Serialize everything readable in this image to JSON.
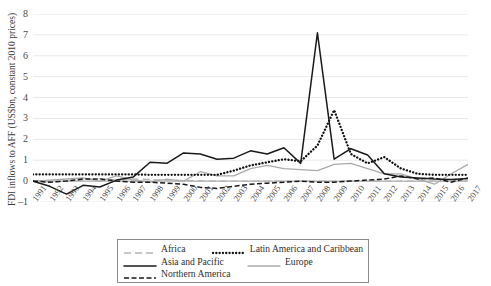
{
  "chart_data": {
    "type": "line",
    "title": "",
    "xlabel": "",
    "ylabel": "FDI inflows to AFF (US$bn, constant 2010 prices)",
    "ylim": [
      -1,
      8
    ],
    "yticks": [
      -1,
      0,
      1,
      2,
      3,
      4,
      5,
      6,
      7,
      8
    ],
    "grid": true,
    "legend_position": "bottom",
    "x": [
      1991,
      1992,
      1993,
      1994,
      1995,
      1996,
      1997,
      1998,
      1999,
      2000,
      2001,
      2002,
      2003,
      2004,
      2005,
      2006,
      2007,
      2008,
      2009,
      2010,
      2011,
      2012,
      2013,
      2014,
      2015,
      2016,
      2017
    ],
    "categories": [
      "1991",
      "1992",
      "1993",
      "1994",
      "1995",
      "1996",
      "1997",
      "1998",
      "1999",
      "2000",
      "2001",
      "2002",
      "2003",
      "2004",
      "2005",
      "2006",
      "2007",
      "2008",
      "2009",
      "2010",
      "2011",
      "2012",
      "2013",
      "2014",
      "2015",
      "2016",
      "2017"
    ],
    "series": [
      {
        "name": "Africa",
        "color": "#b4b4b4",
        "style": "long-dash",
        "values": [
          0.02,
          -0.05,
          0.02,
          0.05,
          0.12,
          0.05,
          0.1,
          0.08,
          0.05,
          0.03,
          0.02,
          0.0,
          0.0,
          0.0,
          0.0,
          0.0,
          0.0,
          0.0,
          0.0,
          0.0,
          0.0,
          0.0,
          0.0,
          0.0,
          0.0,
          0.0,
          0.0
        ]
      },
      {
        "name": "Asia and Pacific",
        "color": "#1a1a1a",
        "style": "solid",
        "values": [
          0.0,
          -0.25,
          -0.62,
          -0.2,
          -0.28,
          0.05,
          0.2,
          0.9,
          0.85,
          1.35,
          1.3,
          1.05,
          1.1,
          1.45,
          1.3,
          1.6,
          0.85,
          7.1,
          1.05,
          1.55,
          1.25,
          0.35,
          0.2,
          0.15,
          0.1,
          0.08,
          0.12
        ]
      },
      {
        "name": "Northern America",
        "color": "#1a1a1a",
        "style": "dash",
        "values": [
          0.0,
          -0.05,
          0.0,
          0.1,
          0.1,
          0.0,
          -0.05,
          -0.05,
          -0.1,
          -0.15,
          -0.3,
          -0.35,
          -0.25,
          -0.15,
          -0.1,
          -0.05,
          0.0,
          -0.05,
          -0.05,
          0.0,
          0.05,
          0.1,
          0.25,
          0.1,
          0.15,
          -0.05,
          0.15
        ]
      },
      {
        "name": "Latin America and Caribbean",
        "color": "#111111",
        "style": "dot",
        "values": [
          0.32,
          0.32,
          0.32,
          0.32,
          0.32,
          0.32,
          0.32,
          0.3,
          0.3,
          0.3,
          0.3,
          0.3,
          0.5,
          0.75,
          0.9,
          1.05,
          0.95,
          1.7,
          3.4,
          1.3,
          0.85,
          1.15,
          0.6,
          0.35,
          0.3,
          0.3,
          0.3
        ]
      },
      {
        "name": "Europe",
        "color": "#aaaaaa",
        "style": "solid-gray",
        "values": [
          0.0,
          0.05,
          0.1,
          0.15,
          0.0,
          0.25,
          0.05,
          -0.05,
          0.1,
          0.0,
          0.45,
          0.25,
          0.25,
          0.6,
          0.75,
          0.6,
          0.55,
          0.5,
          0.8,
          0.85,
          0.6,
          0.35,
          0.35,
          0.1,
          -0.15,
          0.35,
          0.8
        ]
      }
    ]
  },
  "axes": {
    "y_title": "FDI inflows to AFF (US$bn, constant 2010 prices)",
    "y_ticks": [
      "8",
      "7",
      "6",
      "5",
      "4",
      "3",
      "2",
      "1",
      "0",
      "-1"
    ]
  },
  "legend": {
    "rows": [
      [
        {
          "label": "Africa",
          "style": "long-dash",
          "color": "#b4b4b4"
        },
        {
          "label": "Latin America and Caribbean",
          "style": "dot",
          "color": "#111111"
        }
      ],
      [
        {
          "label": "Asia and Pacific",
          "style": "solid",
          "color": "#1a1a1a"
        },
        {
          "label": "Europe",
          "style": "solid-gray",
          "color": "#aaaaaa"
        }
      ],
      [
        {
          "label": "Northern America",
          "style": "dash",
          "color": "#1a1a1a"
        }
      ]
    ]
  }
}
